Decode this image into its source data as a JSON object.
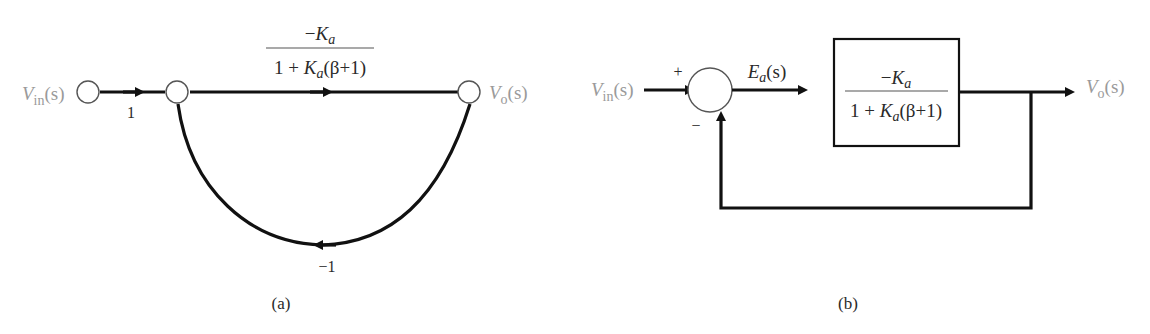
{
  "figure_a": {
    "caption": "(a)",
    "type": "signal-flow graph",
    "nodes": {
      "input_label_main": "V",
      "input_label_sub": "in",
      "input_label_arg": "(s)",
      "output_label_main": "V",
      "output_label_sub": "o",
      "output_label_arg": "(s)"
    },
    "branch_input_gain": "1",
    "forward_gain": {
      "numerator_sign": "−",
      "numerator_var": "K",
      "numerator_sub": "a",
      "denominator_prefix": "1 + ",
      "denominator_var": "K",
      "denominator_sub": "a",
      "denominator_suffix": "(β+1)"
    },
    "feedback_gain": "−1"
  },
  "figure_b": {
    "caption": "(b)",
    "type": "block diagram",
    "input_label_main": "V",
    "input_label_sub": "in",
    "input_label_arg": "(s)",
    "summer_plus": "+",
    "summer_minus": "−",
    "error_label_main": "E",
    "error_label_sub": "a",
    "error_label_arg": "(s)",
    "block_gain": {
      "numerator_sign": "−",
      "numerator_var": "K",
      "numerator_sub": "a",
      "denominator_prefix": "1 + ",
      "denominator_var": "K",
      "denominator_sub": "a",
      "denominator_suffix": "(β+1)"
    },
    "output_label_main": "V",
    "output_label_sub": "o",
    "output_label_arg": "(s)"
  }
}
